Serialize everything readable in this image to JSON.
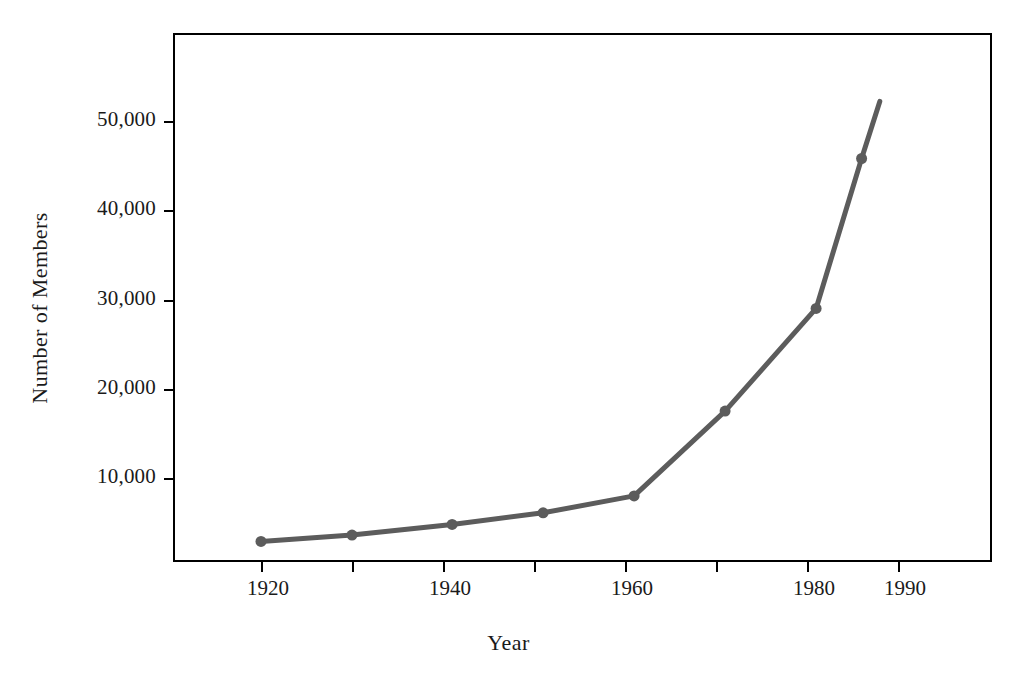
{
  "chart_data": {
    "type": "line",
    "title": "",
    "xlabel": "Year",
    "ylabel": "Number of Members",
    "x": [
      1920,
      1930,
      1941,
      1951,
      1961,
      1971,
      1981,
      1986,
      1988
    ],
    "values": [
      2900,
      3600,
      4800,
      6100,
      8000,
      17500,
      29000,
      45800,
      52200
    ],
    "series": [
      {
        "name": "Number of Members",
        "color": "#5c5c5c",
        "marker": "circle",
        "points": [
          {
            "x": 1920,
            "y": 2900
          },
          {
            "x": 1930,
            "y": 3600
          },
          {
            "x": 1941,
            "y": 4800
          },
          {
            "x": 1951,
            "y": 6100
          },
          {
            "x": 1961,
            "y": 8000
          },
          {
            "x": 1971,
            "y": 17500
          },
          {
            "x": 1981,
            "y": 29000
          },
          {
            "x": 1986,
            "y": 45800
          },
          {
            "x": 1988,
            "y": 52200
          }
        ]
      }
    ],
    "xlim": [
      1910,
      2000
    ],
    "ylim": [
      600,
      60000
    ],
    "xticks": [
      {
        "value": 1920,
        "label": "1920"
      },
      {
        "value": 1930,
        "label": ""
      },
      {
        "value": 1940,
        "label": "1940"
      },
      {
        "value": 1950,
        "label": ""
      },
      {
        "value": 1960,
        "label": "1960"
      },
      {
        "value": 1970,
        "label": ""
      },
      {
        "value": 1980,
        "label": "1980"
      },
      {
        "value": 1990,
        "label": "1990"
      }
    ],
    "yticks": [
      {
        "value": 50000,
        "label": "50,000"
      },
      {
        "value": 40000,
        "label": "40,000"
      },
      {
        "value": 30000,
        "label": "30,000"
      },
      {
        "value": 20000,
        "label": "20,000"
      },
      {
        "value": 10000,
        "label": "10,000"
      }
    ],
    "grid": false,
    "legend": false,
    "frame": true,
    "axis_color": "#000000",
    "background": "#ffffff"
  }
}
